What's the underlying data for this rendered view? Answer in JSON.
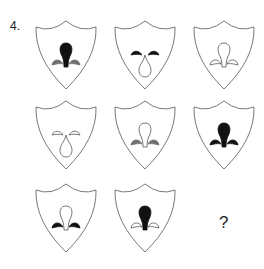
{
  "question": {
    "number_label": "4.",
    "missing_label": "?"
  },
  "colors": {
    "black": "#111111",
    "gray": "#6f6f6f",
    "white": "#ffffff",
    "outline": "#555555"
  },
  "grid": {
    "rows": 3,
    "cols": 3,
    "cells": [
      {
        "row": 1,
        "col": 1,
        "center": {
          "orientation": "up",
          "fill": "black"
        },
        "sides": {
          "orientation": "up",
          "fill": "gray"
        }
      },
      {
        "row": 1,
        "col": 2,
        "center": {
          "orientation": "down",
          "fill": "white"
        },
        "sides": {
          "orientation": "down",
          "fill": "black"
        }
      },
      {
        "row": 1,
        "col": 3,
        "center": {
          "orientation": "up",
          "fill": "white"
        },
        "sides": {
          "orientation": "up",
          "fill": "white"
        }
      },
      {
        "row": 2,
        "col": 1,
        "center": {
          "orientation": "down",
          "fill": "white"
        },
        "sides": {
          "orientation": "down",
          "fill": "white"
        }
      },
      {
        "row": 2,
        "col": 2,
        "center": {
          "orientation": "up",
          "fill": "white"
        },
        "sides": {
          "orientation": "up",
          "fill": "gray"
        }
      },
      {
        "row": 2,
        "col": 3,
        "center": {
          "orientation": "up",
          "fill": "black"
        },
        "sides": {
          "orientation": "up",
          "fill": "black"
        }
      },
      {
        "row": 3,
        "col": 1,
        "center": {
          "orientation": "up",
          "fill": "white"
        },
        "sides": {
          "orientation": "up",
          "fill": "black"
        }
      },
      {
        "row": 3,
        "col": 2,
        "center": {
          "orientation": "up",
          "fill": "black"
        },
        "sides": {
          "orientation": "up",
          "fill": "white"
        }
      },
      {
        "row": 3,
        "col": 3,
        "missing": true
      }
    ]
  }
}
